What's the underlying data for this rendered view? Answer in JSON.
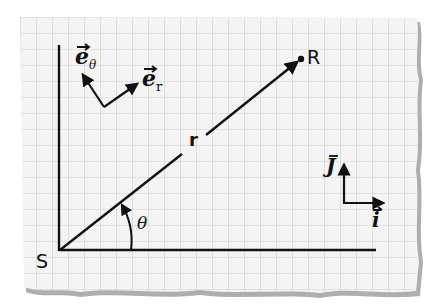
{
  "diagram": {
    "type": "polar-coordinate-vectors",
    "background": "graph-paper",
    "colors": {
      "paper": "#f4f4f4",
      "grid": "#cfcfcf",
      "ink": "#111111",
      "torn_edge": "#9a9a9a"
    },
    "points": {
      "origin": {
        "label": "S"
      },
      "target": {
        "label": "R"
      }
    },
    "labels": {
      "radius": "r",
      "angle": "θ",
      "unit_r": "e",
      "unit_r_sub": "r",
      "unit_theta": "e",
      "unit_theta_sub": "θ",
      "unit_i": "i",
      "unit_j": "J"
    }
  }
}
